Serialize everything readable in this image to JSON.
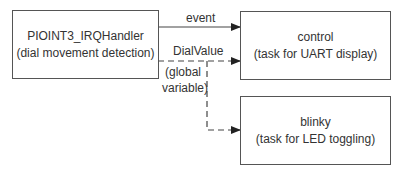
{
  "diagram": {
    "nodes": [
      {
        "id": "irq",
        "title": "PIOINT3_IRQHandler",
        "subtitle": "(dial movement detection)"
      },
      {
        "id": "control",
        "title": "control",
        "subtitle": "(task for UART display)"
      },
      {
        "id": "blinky",
        "title": "blinky",
        "subtitle": "(task for LED toggling)"
      }
    ],
    "edges": [
      {
        "from": "irq",
        "to": "control",
        "label": "event",
        "style": "solid"
      },
      {
        "from": "irq",
        "to": "control",
        "label": "DialValue",
        "style": "dashed"
      },
      {
        "from": "irq",
        "to": "blinky",
        "label": "DialValue",
        "style": "dashed"
      }
    ],
    "annotation": {
      "line1": "(global",
      "line2": "variable)"
    }
  }
}
